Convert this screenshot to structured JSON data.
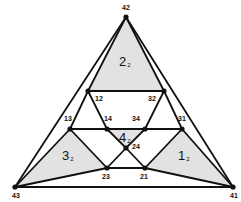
{
  "diagram": {
    "type": "nested-triangle-graph",
    "vertices": [
      {
        "id": "42",
        "label": "42",
        "x": 126,
        "y": 17,
        "lx": 122,
        "ly": 10
      },
      {
        "id": "43",
        "label": "43",
        "x": 15,
        "y": 187,
        "lx": 12,
        "ly": 198
      },
      {
        "id": "41",
        "label": "41",
        "x": 233,
        "y": 187,
        "lx": 230,
        "ly": 198
      },
      {
        "id": "12",
        "label": "12",
        "x": 88,
        "y": 91,
        "lx": 95,
        "ly": 101
      },
      {
        "id": "32",
        "label": "32",
        "x": 164,
        "y": 91,
        "lx": 148,
        "ly": 101
      },
      {
        "id": "13",
        "label": "13",
        "x": 70,
        "y": 129,
        "lx": 64,
        "ly": 121
      },
      {
        "id": "31",
        "label": "31",
        "x": 182,
        "y": 129,
        "lx": 178,
        "ly": 121
      },
      {
        "id": "14",
        "label": "14",
        "x": 107,
        "y": 129,
        "lx": 104,
        "ly": 121
      },
      {
        "id": "34",
        "label": "34",
        "x": 145,
        "y": 129,
        "lx": 132,
        "ly": 121
      },
      {
        "id": "24",
        "label": "24",
        "x": 126,
        "y": 148,
        "lx": 132,
        "ly": 149
      },
      {
        "id": "23",
        "label": "23",
        "x": 107,
        "y": 168,
        "lx": 102,
        "ly": 179
      },
      {
        "id": "21",
        "label": "21",
        "x": 145,
        "y": 168,
        "lx": 140,
        "ly": 179
      }
    ],
    "edges": [
      [
        "42",
        "43"
      ],
      [
        "42",
        "41"
      ],
      [
        "43",
        "41"
      ],
      [
        "42",
        "12"
      ],
      [
        "42",
        "32"
      ],
      [
        "12",
        "32"
      ],
      [
        "12",
        "13"
      ],
      [
        "12",
        "14"
      ],
      [
        "32",
        "31"
      ],
      [
        "32",
        "34"
      ],
      [
        "13",
        "14"
      ],
      [
        "14",
        "34"
      ],
      [
        "34",
        "31"
      ],
      [
        "13",
        "43"
      ],
      [
        "13",
        "23"
      ],
      [
        "43",
        "23"
      ],
      [
        "31",
        "41"
      ],
      [
        "31",
        "21"
      ],
      [
        "41",
        "21"
      ],
      [
        "14",
        "24"
      ],
      [
        "34",
        "24"
      ],
      [
        "24",
        "23"
      ],
      [
        "24",
        "21"
      ],
      [
        "23",
        "21"
      ]
    ],
    "shaded_regions": [
      {
        "id": "region-2",
        "label": "2",
        "sub": "2",
        "points": [
          "42",
          "12",
          "32"
        ],
        "lx": 119,
        "ly": 66
      },
      {
        "id": "region-3",
        "label": "3",
        "sub": "2",
        "points": [
          "43",
          "13",
          "23"
        ],
        "lx": 62,
        "ly": 160
      },
      {
        "id": "region-1",
        "label": "1",
        "sub": "2",
        "points": [
          "41",
          "31",
          "21"
        ],
        "lx": 178,
        "ly": 160
      },
      {
        "id": "region-4",
        "label": "4",
        "sub": "2",
        "points": [
          "14",
          "34",
          "24"
        ],
        "lx": 119,
        "ly": 142
      }
    ],
    "colors": {
      "stroke": "#111111",
      "shade": "#e2e2e2",
      "background": "#ffffff"
    }
  }
}
